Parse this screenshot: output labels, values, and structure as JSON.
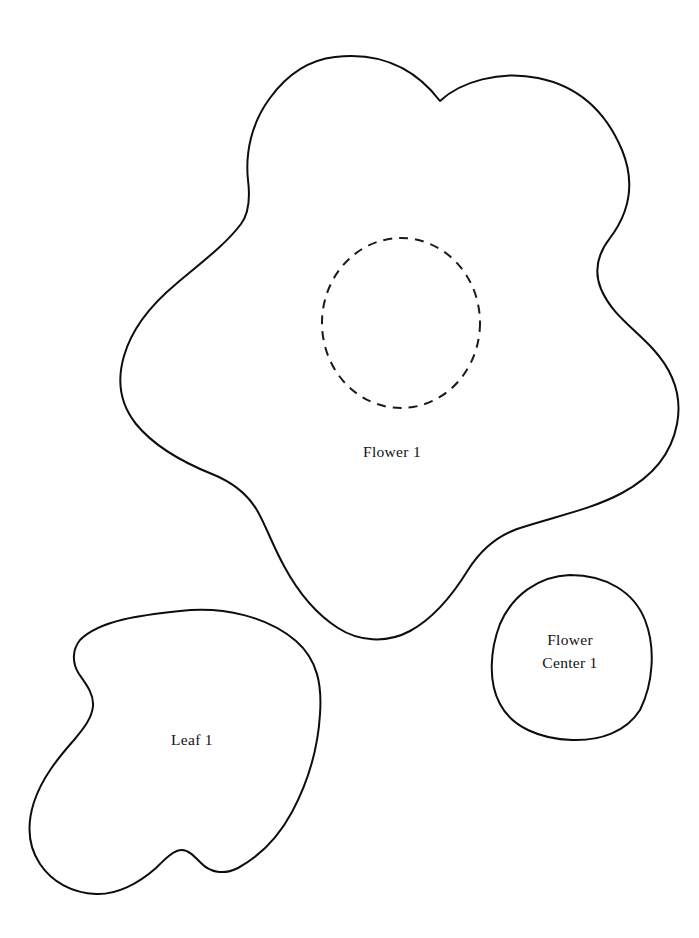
{
  "document": {
    "kind": "craft-pattern-template",
    "background_color": "#ffffff",
    "line_color": "#0d0d0d",
    "canvas": {
      "width": 699,
      "height": 938
    }
  },
  "pieces": [
    {
      "id": "flower",
      "name": "flower-outline",
      "label": "Flower 1",
      "label_lines": [
        "Flower 1"
      ],
      "label_x": 392,
      "label_y": 453,
      "stroke_style": "solid",
      "path": "M 335 57 C 392 50 424 80 440 101 C 460 82 500 70 538 78 C 578 86 606 112 622 150 C 636 184 628 214 610 238 C 596 256 594 272 601 289 C 612 315 634 328 653 349 C 674 372 682 398 677 424 C 671 456 650 478 622 493 C 590 510 556 516 517 529 C 495 537 480 551 468 570 C 452 596 434 618 410 631 C 386 644 358 641 338 628 C 316 614 298 592 284 566 C 272 544 266 526 258 512 C 248 494 232 482 212 474 C 182 462 154 446 136 424 C 120 404 117 380 124 356 C 132 328 152 304 176 284 C 202 262 226 244 241 224 C 250 212 250 196 248 180 C 245 152 252 122 270 98 C 286 76 308 60 335 57 Z"
    },
    {
      "id": "flower-center-marking",
      "name": "flower-center-placement-circle",
      "label": "",
      "stroke_style": "dashed",
      "shape": "ellipse",
      "cx": 401,
      "cy": 323,
      "rx": 79,
      "ry": 85
    },
    {
      "id": "leaf",
      "name": "leaf-outline",
      "label": "Leaf 1",
      "label_lines": [
        "Leaf 1"
      ],
      "label_x": 192,
      "label_y": 741,
      "stroke_style": "solid",
      "path": "M 180 611 C 224 606 268 617 296 641 C 318 660 322 686 320 714 C 318 748 308 782 292 812 C 278 838 260 856 238 868 C 224 875 210 873 200 862 C 193 855 188 850 182 850 C 174 850 166 858 156 868 C 138 884 116 895 96 894 C 72 893 52 882 40 864 C 28 846 27 824 34 802 C 42 778 58 758 74 740 C 84 728 92 718 93 706 C 94 694 86 684 79 674 C 72 663 72 650 80 640 C 100 620 142 615 180 611 Z"
    },
    {
      "id": "flower-center",
      "name": "flower-center-piece",
      "label": "Flower Center 1",
      "label_lines": [
        "Flower",
        "Center 1"
      ],
      "label_x": 570,
      "label_y": 648,
      "label_line_height": 22,
      "stroke_style": "solid",
      "path": "M 570 575 C 606 575 634 592 645 620 C 656 648 653 684 640 710 C 626 732 600 741 572 740 C 540 739 512 727 500 704 C 488 682 490 650 500 624 C 512 596 538 576 570 575 Z"
    }
  ]
}
